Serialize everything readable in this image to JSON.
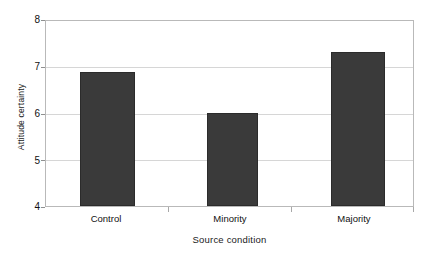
{
  "chart_data": {
    "type": "bar",
    "title": "",
    "xlabel": "Source condition",
    "ylabel": "Attitude certainty",
    "categories": [
      "Control",
      "Minority",
      "Majority"
    ],
    "values": [
      6.89,
      6.0,
      7.32
    ],
    "ylim": [
      4,
      8
    ],
    "yticks": [
      4,
      5,
      6,
      7,
      8
    ],
    "ytick_labels": [
      "4",
      "5",
      "6",
      "7",
      "8"
    ],
    "grid": true,
    "legend": "none",
    "series": [
      {
        "name": "Attitude certainty",
        "values": [
          6.89,
          6.0,
          7.32
        ],
        "color": "#3a3a3a"
      }
    ]
  },
  "colors": {
    "bar_fill": "#3a3a3a",
    "bar_border": "#2b2b2b",
    "gridline": "#d6d6d6",
    "plot_border": "#b9b9b9",
    "tick_mark": "#a8a8a8",
    "background": "#ffffff",
    "text": "#111111"
  }
}
